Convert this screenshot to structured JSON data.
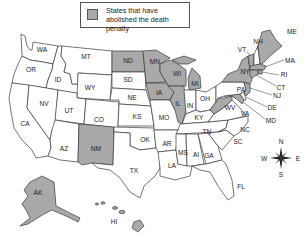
{
  "legend": {
    "text": "States that have abolished the death penalty",
    "swatch_color": "#a9a9a9"
  },
  "colors": {
    "abolished": "#a9a9a9",
    "not_abolished": "#ffffff",
    "border": "#3a3a3a"
  },
  "compass": {
    "n": "N",
    "s": "S",
    "e": "E",
    "w": "W"
  },
  "states": {
    "WA": {
      "label": "WA",
      "abolished": false
    },
    "OR": {
      "label": "OR",
      "abolished": false
    },
    "CA": {
      "label": "CA",
      "abolished": false
    },
    "ID": {
      "label": "ID",
      "abolished": false
    },
    "NV": {
      "label": "NV",
      "abolished": false
    },
    "MT": {
      "label": "MT",
      "abolished": false
    },
    "WY": {
      "label": "WY",
      "abolished": false
    },
    "UT": {
      "label": "UT",
      "abolished": false
    },
    "AZ": {
      "label": "AZ",
      "abolished": false
    },
    "CO": {
      "label": "CO",
      "abolished": false
    },
    "NM": {
      "label": "NM",
      "abolished": true
    },
    "ND": {
      "label": "ND",
      "abolished": true
    },
    "SD": {
      "label": "SD",
      "abolished": false
    },
    "NE": {
      "label": "NE",
      "abolished": false
    },
    "KS": {
      "label": "KS",
      "abolished": false
    },
    "OK": {
      "label": "OK",
      "abolished": false
    },
    "TX": {
      "label": "TX",
      "abolished": false
    },
    "MN": {
      "label": "MN",
      "abolished": true
    },
    "IA": {
      "label": "IA",
      "abolished": true
    },
    "MO": {
      "label": "MO",
      "abolished": false
    },
    "AR": {
      "label": "AR",
      "abolished": false
    },
    "LA": {
      "label": "LA",
      "abolished": false
    },
    "WI": {
      "label": "WI",
      "abolished": true
    },
    "IL": {
      "label": "IL",
      "abolished": true
    },
    "MI": {
      "label": "MI",
      "abolished": true
    },
    "IN": {
      "label": "IN",
      "abolished": false
    },
    "OH": {
      "label": "OH",
      "abolished": false
    },
    "KY": {
      "label": "KY",
      "abolished": false
    },
    "TN": {
      "label": "TN",
      "abolished": false
    },
    "MS": {
      "label": "MS",
      "abolished": false
    },
    "AL": {
      "label": "Al",
      "abolished": false
    },
    "GA": {
      "label": "GA",
      "abolished": false
    },
    "FL": {
      "label": "FL",
      "abolished": false
    },
    "SC": {
      "label": "SC",
      "abolished": false
    },
    "NC": {
      "label": "NC",
      "abolished": false
    },
    "VA": {
      "label": "VA",
      "abolished": false
    },
    "WV": {
      "label": "WV",
      "abolished": true
    },
    "PA": {
      "label": "PA",
      "abolished": false
    },
    "NY": {
      "label": "NY",
      "abolished": true
    },
    "VT": {
      "label": "VT",
      "abolished": true
    },
    "NH": {
      "label": "NH",
      "abolished": false
    },
    "ME": {
      "label": "ME",
      "abolished": true
    },
    "MA": {
      "label": "MA",
      "abolished": true
    },
    "RI": {
      "label": "RI",
      "abolished": true
    },
    "CT": {
      "label": "CT",
      "abolished": true
    },
    "NJ": {
      "label": "NJ",
      "abolished": true
    },
    "DE": {
      "label": "DE",
      "abolished": false
    },
    "MD": {
      "label": "MD",
      "abolished": true
    },
    "AK": {
      "label": "AK",
      "abolished": true
    },
    "HI": {
      "label": "HI",
      "abolished": true
    }
  }
}
